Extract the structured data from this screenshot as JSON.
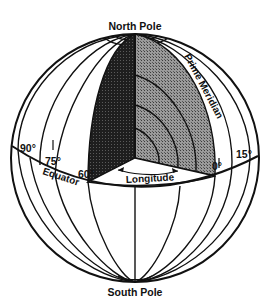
{
  "diagram": {
    "labels": {
      "north_pole": "North Pole",
      "south_pole": "South Pole",
      "prime_meridian": "Prime Meridian",
      "equator": "Equator",
      "longitude": "Longitude"
    },
    "degree_labels": {
      "deg90": "90°",
      "deg75": "75°",
      "deg60": "60°",
      "deg0": "0°",
      "deg15": "15°"
    },
    "colors": {
      "line": "#111111",
      "dark_wedge": "#2a2a2a",
      "light_wedge": "#8c8c8c",
      "background": "#ffffff"
    }
  }
}
